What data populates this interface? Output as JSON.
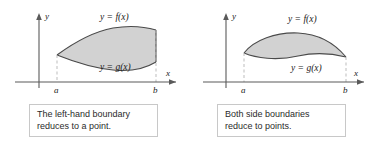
{
  "figures": [
    {
      "id": "left-hand-boundary-figure",
      "axes": {
        "y_axis_label": "y",
        "x_axis_label": "x",
        "x_ticks": [
          "a",
          "b"
        ]
      },
      "curve_labels": {
        "upper": "y = f(x)",
        "lower": "y = g(x)"
      },
      "caption": {
        "line1": "The left-hand boundary",
        "line2": "reduces to a point."
      }
    },
    {
      "id": "both-side-boundaries-figure",
      "axes": {
        "y_axis_label": "y",
        "x_axis_label": "x",
        "x_ticks": [
          "a",
          "b"
        ]
      },
      "curve_labels": {
        "upper": "y = f(x)",
        "lower": "y = g(x)"
      },
      "caption": {
        "line1": "Both side boundaries",
        "line2": "reduce to points."
      }
    }
  ],
  "colors": {
    "region_fill": "#d2d2d2",
    "curve_stroke": "#4a4a4a",
    "axis_stroke": "#5a5a5a",
    "dashed_guide": "#b5b5b5",
    "caption_border": "#c8c8c8",
    "text": "#1a1a1a",
    "background": "#ffffff"
  }
}
